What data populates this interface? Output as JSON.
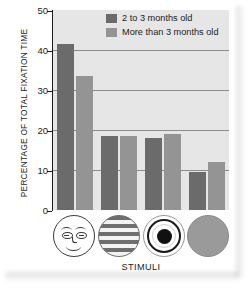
{
  "chart_data": {
    "type": "bar",
    "title": "",
    "xlabel": "STIMULI",
    "ylabel": "PERCENTAGE OF TOTAL FIXATION TIME",
    "ylim": [
      0,
      50
    ],
    "yticks": [
      "0",
      "10",
      "20",
      "30",
      "40",
      "50"
    ],
    "grid": true,
    "legend_position": "top-right-inside",
    "categories": [
      "face",
      "horizontal-stripes",
      "bullseye",
      "plain-circle"
    ],
    "category_icon_names": [
      "face-stimulus-icon",
      "horizontal-stripes-stimulus-icon",
      "bullseye-stimulus-icon",
      "plain-circle-stimulus-icon"
    ],
    "series": [
      {
        "name": "2 to 3 months old",
        "color": "#6b6b6b",
        "values": [
          41.5,
          18.5,
          18.0,
          9.5
        ]
      },
      {
        "name": "More than 3 months old",
        "color": "#949494",
        "values": [
          33.5,
          18.5,
          19.0,
          12.0
        ]
      }
    ]
  },
  "legend": {
    "items": [
      {
        "label": "2 to 3 months old",
        "swatch": "#6b6b6b"
      },
      {
        "label": "More than 3 months old",
        "swatch": "#949494"
      }
    ]
  },
  "axes": {
    "y_title": "PERCENTAGE OF TOTAL FIXATION TIME",
    "x_title": "STIMULI",
    "y_tick_labels": [
      "50",
      "40",
      "30",
      "20",
      "10",
      "0"
    ]
  },
  "colors": {
    "plot_background": "#e6e6e6",
    "gridline": "#8c8c8c",
    "axis": "#1c1c1c",
    "series_1": "#6b6b6b",
    "series_2": "#949494",
    "page_background": "#ffffff"
  }
}
